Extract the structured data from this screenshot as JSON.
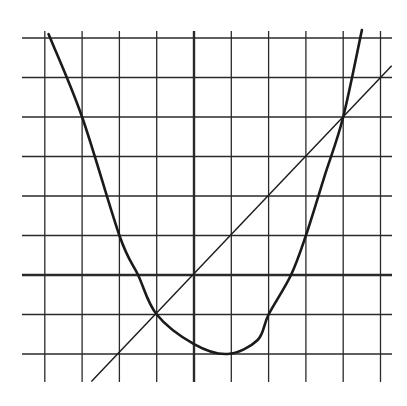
{
  "chart_data": {
    "type": "line",
    "title": "",
    "xlabel": "",
    "ylabel": "",
    "grid": true,
    "xlim": [
      -4,
      5
    ],
    "ylim": [
      -2,
      6
    ],
    "x_gridlines": [
      -4,
      -3,
      -2,
      -1,
      0,
      1,
      2,
      3,
      4,
      5
    ],
    "y_gridlines": [
      -2,
      -1,
      0,
      1,
      2,
      3,
      4,
      5,
      6
    ],
    "axes": {
      "x_axis_at_y": 0,
      "y_axis_at_x": 0
    },
    "series": [
      {
        "name": "parabola",
        "kind": "curve",
        "points": [
          [
            -3.9,
            6.1
          ],
          [
            -3,
            4
          ],
          [
            -2,
            1
          ],
          [
            -1.5,
            0
          ],
          [
            -1,
            -1
          ],
          [
            0,
            -1.75
          ],
          [
            0.9,
            -2
          ],
          [
            1.7,
            -1.65
          ],
          [
            2,
            -1
          ],
          [
            2.6,
            0
          ],
          [
            3,
            1
          ],
          [
            3.5,
            2.5
          ],
          [
            4,
            4
          ],
          [
            4.5,
            6.2
          ]
        ]
      },
      {
        "name": "line",
        "kind": "line",
        "points": [
          [
            -2.75,
            -2.7
          ],
          [
            5.3,
            5.3
          ]
        ]
      }
    ],
    "intersections": [
      [
        -1,
        -1
      ],
      [
        4,
        4
      ]
    ]
  },
  "colors": {
    "grid": "#2a2a2a",
    "curve": "#1a1a1a",
    "background": "#ffffff"
  }
}
